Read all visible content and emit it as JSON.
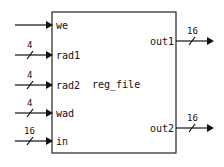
{
  "module": {
    "name": "reg_file",
    "box": {
      "x": 52,
      "y": 12,
      "width": 124,
      "height": 141
    },
    "color": "#111111"
  },
  "inputs": [
    {
      "label": "we",
      "width": null,
      "y": 25
    },
    {
      "label": "rad1",
      "width": "4",
      "y": 55
    },
    {
      "label": "rad2",
      "width": "4",
      "y": 85
    },
    {
      "label": "wad",
      "width": "4",
      "y": 113
    },
    {
      "label": "in",
      "width": "16",
      "y": 141
    }
  ],
  "outputs": [
    {
      "label": "out1",
      "width": "16",
      "y": 41
    },
    {
      "label": "out2",
      "width": "16",
      "y": 128
    }
  ]
}
